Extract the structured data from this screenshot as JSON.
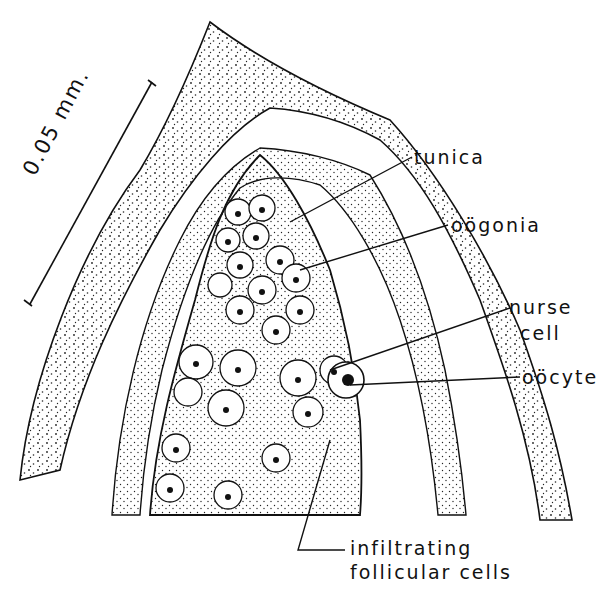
{
  "figure": {
    "scale_bar": {
      "label": "0.05 mm."
    },
    "labels": {
      "tunica": "tunica",
      "oogonia": "oögonia",
      "nurse_cell_1": "nurse",
      "nurse_cell_2": "cell",
      "oocyte": "oöcyte",
      "infiltrating_1": "infiltrating",
      "infiltrating_2": "follicular cells"
    },
    "colors": {
      "ink": "#111111",
      "paper": "#ffffff"
    }
  }
}
